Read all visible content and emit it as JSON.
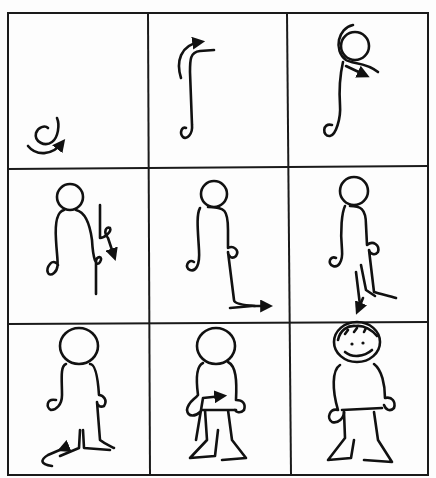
{
  "figure": {
    "type": "step-by-step drawing guide",
    "grid": {
      "rows": 3,
      "cols": 3
    },
    "colors": {
      "ink": "#111111",
      "paper": "#fdfdfd",
      "grid_line": "#1a1a1a"
    },
    "panels": [
      {
        "step": 1,
        "depicts": "head-stroke-start",
        "icon": "curl-with-arrow-icon"
      },
      {
        "step": 2,
        "depicts": "body-and-arm-stroke",
        "icon": "hook-stroke-with-arrow-icon"
      },
      {
        "step": 3,
        "depicts": "head-circle-added",
        "icon": "head-circle-arrow-icon"
      },
      {
        "step": 4,
        "depicts": "right-side-and-hand",
        "icon": "right-arm-loop-arrow-icon"
      },
      {
        "step": 5,
        "depicts": "right-leg-foot",
        "icon": "foot-arrow-icon"
      },
      {
        "step": 6,
        "depicts": "inner-leg-up",
        "icon": "inner-leg-arrow-icon"
      },
      {
        "step": 7,
        "depicts": "left-leg-foot",
        "icon": "left-foot-arrow-icon"
      },
      {
        "step": 8,
        "depicts": "waist-line",
        "icon": "waist-arrow-icon"
      },
      {
        "step": 9,
        "depicts": "finished-smiling-figure",
        "icon": "smiling-figure-icon"
      }
    ]
  }
}
